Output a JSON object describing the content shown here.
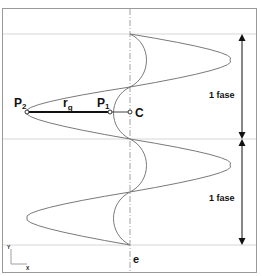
{
  "diagram": {
    "labels": {
      "p2": "P",
      "p2_sub": "2",
      "p1": "P",
      "p1_sub": "1",
      "radius": "r",
      "radius_sub": "g",
      "center": "C",
      "phase_top": "1 fase",
      "phase_bottom": "1 fase",
      "end": "e",
      "axis_y": "Y",
      "axis_x": "X"
    },
    "colors": {
      "frame": "#9a9a9a",
      "curve": "#7a7a7a",
      "guide": "#d6d6d6",
      "axis": "#a0a0a0",
      "arrow": "#111111",
      "segment": "#111111"
    }
  }
}
